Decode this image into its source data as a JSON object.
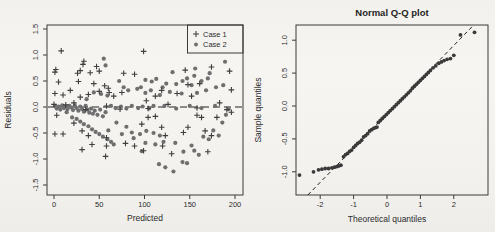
{
  "figure": {
    "background": "#f3f2ef",
    "ink": "#2b2b2b"
  },
  "chart_data": [
    {
      "type": "scatter",
      "title": "",
      "xlabel": "Predicted",
      "ylabel": "Residuals",
      "xlim": [
        0,
        200
      ],
      "ylim": [
        -1.5,
        1.5
      ],
      "xticks": [
        "0",
        "50",
        "100",
        "150",
        "200"
      ],
      "yticks": [
        "1.5",
        "1.0",
        "0.5",
        "0.0",
        "-0.5",
        "-1.0",
        "-1.5"
      ],
      "grid": false,
      "legend_position": "top-right",
      "zero_line": {
        "y": 0,
        "style": "dashed"
      },
      "series": [
        {
          "name": "Case 1",
          "marker": "plus",
          "color": "#3e3e3e",
          "points": [
            [
              8,
              1.08
            ],
            [
              99,
              1.07
            ],
            [
              1,
              0.67
            ],
            [
              2,
              0.72
            ],
            [
              5,
              0.48
            ],
            [
              26,
              0.65
            ],
            [
              27,
              0.49
            ],
            [
              29,
              0.7
            ],
            [
              32,
              0.82
            ],
            [
              33,
              0.88
            ],
            [
              40,
              0.66
            ],
            [
              44,
              0.45
            ],
            [
              47,
              0.78
            ],
            [
              50,
              0.69
            ],
            [
              56,
              0.41
            ],
            [
              60,
              0.36
            ],
            [
              61,
              0.28
            ],
            [
              77,
              0.65
            ],
            [
              89,
              0.63
            ],
            [
              145,
              0.71
            ],
            [
              174,
              0.77
            ],
            [
              148,
              0.43
            ],
            [
              161,
              0.45
            ],
            [
              194,
              0.69
            ],
            [
              196,
              0.33
            ],
            [
              1,
              0.26
            ],
            [
              10,
              0.23
            ],
            [
              18,
              0.32
            ],
            [
              29,
              0.19
            ],
            [
              38,
              0.24
            ],
            [
              50,
              0.3
            ],
            [
              66,
              0.21
            ],
            [
              75,
              0.28
            ],
            [
              112,
              0.21
            ],
            [
              119,
              0.32
            ],
            [
              136,
              0.26
            ],
            [
              152,
              0.21
            ],
            [
              0,
              0.05
            ],
            [
              13,
              0.04
            ],
            [
              22,
              0.08
            ],
            [
              35,
              -0.05
            ],
            [
              58,
              0.02
            ],
            [
              73,
              -0.04
            ],
            [
              102,
              0.12
            ],
            [
              104,
              -0.03
            ],
            [
              126,
              0.05
            ],
            [
              158,
              -0.02
            ],
            [
              183,
              0.08
            ],
            [
              191,
              -0.05
            ],
            [
              3,
              -0.16
            ],
            [
              1,
              -0.52
            ],
            [
              10,
              -0.52
            ],
            [
              22,
              -0.31
            ],
            [
              31,
              -0.46
            ],
            [
              38,
              -0.55
            ],
            [
              42,
              -0.72
            ],
            [
              31,
              -0.82
            ],
            [
              58,
              -0.59
            ],
            [
              58,
              -0.75
            ],
            [
              57,
              -0.95
            ],
            [
              79,
              -0.7
            ],
            [
              89,
              -0.75
            ],
            [
              97,
              -0.33
            ],
            [
              99,
              -0.84
            ],
            [
              104,
              -0.2
            ],
            [
              112,
              -0.18
            ],
            [
              119,
              -0.39
            ],
            [
              123,
              -0.55
            ],
            [
              120,
              -0.75
            ],
            [
              130,
              -0.9
            ],
            [
              143,
              -0.49
            ],
            [
              148,
              -0.39
            ],
            [
              158,
              -0.16
            ],
            [
              163,
              -0.2
            ],
            [
              167,
              -0.46
            ],
            [
              174,
              -0.55
            ],
            [
              180,
              -0.2
            ],
            [
              170,
              -0.86
            ],
            [
              196,
              -0.1
            ]
          ]
        },
        {
          "name": "Case 2",
          "marker": "circle",
          "color": "#6f6f6f",
          "points": [
            [
              1,
              0.02
            ],
            [
              3,
              -0.03
            ],
            [
              5,
              0.01
            ],
            [
              7,
              -0.05
            ],
            [
              9,
              0.03
            ],
            [
              11,
              -0.02
            ],
            [
              13,
              0.01
            ],
            [
              15,
              -0.04
            ],
            [
              17,
              0.02
            ],
            [
              19,
              -0.01
            ],
            [
              21,
              -0.06
            ],
            [
              23,
              0.03
            ],
            [
              25,
              -0.02
            ],
            [
              27,
              -0.07
            ],
            [
              29,
              0.01
            ],
            [
              31,
              -0.04
            ],
            [
              33,
              -0.09
            ],
            [
              35,
              0.02
            ],
            [
              37,
              -0.05
            ],
            [
              39,
              -0.11
            ],
            [
              41,
              -0.03
            ],
            [
              43,
              -0.13
            ],
            [
              45,
              -0.07
            ],
            [
              48,
              -0.15
            ],
            [
              51,
              -0.05
            ],
            [
              54,
              -0.18
            ],
            [
              57,
              -0.1
            ],
            [
              63,
              0.02
            ],
            [
              68,
              -0.02
            ],
            [
              74,
              0.01
            ],
            [
              80,
              -0.03
            ],
            [
              86,
              0.02
            ],
            [
              93,
              -0.02
            ],
            [
              98,
              0.01
            ],
            [
              105,
              -0.03
            ],
            [
              110,
              0.02
            ],
            [
              122,
              0.02
            ],
            [
              135,
              -0.03
            ],
            [
              150,
              0.02
            ],
            [
              163,
              -0.02
            ],
            [
              178,
              0.02
            ],
            [
              193,
              -0.04
            ],
            [
              14,
              -0.1
            ],
            [
              20,
              -0.2
            ],
            [
              25,
              -0.23
            ],
            [
              29,
              -0.28
            ],
            [
              33,
              -0.33
            ],
            [
              38,
              -0.37
            ],
            [
              42,
              -0.43
            ],
            [
              46,
              -0.48
            ],
            [
              50,
              -0.52
            ],
            [
              54,
              -0.57
            ],
            [
              59,
              -0.62
            ],
            [
              63,
              -0.67
            ],
            [
              66,
              -0.72
            ],
            [
              55,
              0.93
            ],
            [
              57,
              0.8
            ],
            [
              189,
              0.87
            ],
            [
              172,
              0.65
            ],
            [
              156,
              0.74
            ],
            [
              131,
              0.67
            ],
            [
              101,
              0.52
            ],
            [
              108,
              0.49
            ],
            [
              113,
              0.54
            ],
            [
              124,
              0.45
            ],
            [
              142,
              0.5
            ],
            [
              152,
              0.42
            ],
            [
              163,
              0.5
            ],
            [
              72,
              0.5
            ],
            [
              77,
              0.38
            ],
            [
              82,
              0.32
            ],
            [
              92,
              0.35
            ],
            [
              101,
              0.27
            ],
            [
              107,
              0.32
            ],
            [
              117,
              0.23
            ],
            [
              128,
              0.29
            ],
            [
              141,
              0.26
            ],
            [
              158,
              0.27
            ],
            [
              168,
              0.32
            ],
            [
              179,
              0.38
            ],
            [
              187,
              0.42
            ],
            [
              44,
              0.28
            ],
            [
              52,
              0.25
            ],
            [
              59,
              0.22
            ],
            [
              36,
              0.15
            ],
            [
              96,
              0.38
            ],
            [
              120,
              0.38
            ],
            [
              135,
              0.44
            ],
            [
              147,
              0.55
            ],
            [
              155,
              0.6
            ],
            [
              170,
              0.55
            ],
            [
              75,
              -0.52
            ],
            [
              86,
              -0.49
            ],
            [
              95,
              -0.52
            ],
            [
              102,
              -0.46
            ],
            [
              110,
              -0.5
            ],
            [
              117,
              -0.55
            ],
            [
              101,
              -0.69
            ],
            [
              112,
              -0.72
            ],
            [
              121,
              -0.67
            ],
            [
              134,
              -0.69
            ],
            [
              116,
              -1.1
            ],
            [
              123,
              -1.16
            ],
            [
              132,
              -1.24
            ],
            [
              142,
              -1.06
            ],
            [
              147,
              -1.08
            ],
            [
              155,
              -0.84
            ],
            [
              160,
              -0.92
            ],
            [
              143,
              -0.86
            ],
            [
              152,
              -0.74
            ],
            [
              165,
              -0.57
            ],
            [
              171,
              -0.62
            ],
            [
              176,
              -0.45
            ],
            [
              182,
              -0.55
            ],
            [
              186,
              -0.3
            ],
            [
              190,
              -0.15
            ],
            [
              97,
              -0.85
            ],
            [
              88,
              -0.6
            ],
            [
              80,
              -0.38
            ],
            [
              69,
              -0.3
            ],
            [
              60,
              -0.45
            ]
          ]
        }
      ]
    },
    {
      "type": "scatter",
      "title": "Normal Q-Q plot",
      "xlabel": "Theoretical quantiles",
      "ylabel": "Sample quantiles",
      "xlim": [
        -2.7,
        2.7
      ],
      "ylim": [
        -1.15,
        1.2
      ],
      "xticks": [
        "-2",
        "-1",
        "0",
        "1",
        "2"
      ],
      "yticks": [
        "1.0",
        "0.5",
        "0.0",
        "-0.5",
        "-1.0"
      ],
      "grid": false,
      "marker": "circle",
      "color": "#3a3a3a",
      "ref_line": {
        "slope": 0.52,
        "intercept": -0.12,
        "style": "dashed"
      },
      "points": [
        [
          -2.62,
          -1.05
        ],
        [
          -2.2,
          -1.0
        ],
        [
          -2.05,
          -0.97
        ],
        [
          -1.95,
          -0.96
        ],
        [
          -1.85,
          -0.95
        ],
        [
          -1.75,
          -0.95
        ],
        [
          -1.65,
          -0.94
        ],
        [
          -1.57,
          -0.93
        ],
        [
          -1.5,
          -0.92
        ],
        [
          -1.44,
          -0.91
        ],
        [
          -1.38,
          -0.9
        ],
        [
          -1.3,
          -0.77
        ],
        [
          -1.24,
          -0.74
        ],
        [
          -1.18,
          -0.72
        ],
        [
          -1.12,
          -0.69
        ],
        [
          -1.06,
          -0.67
        ],
        [
          -1.0,
          -0.63
        ],
        [
          -0.94,
          -0.6
        ],
        [
          -0.88,
          -0.57
        ],
        [
          -0.82,
          -0.55
        ],
        [
          -0.76,
          -0.52
        ],
        [
          -0.7,
          -0.47
        ],
        [
          -0.64,
          -0.45
        ],
        [
          -0.58,
          -0.42
        ],
        [
          -0.52,
          -0.38
        ],
        [
          -0.46,
          -0.36
        ],
        [
          -0.4,
          -0.34
        ],
        [
          -0.35,
          -0.33
        ],
        [
          -0.3,
          -0.32
        ],
        [
          -0.26,
          -0.25
        ],
        [
          -0.2,
          -0.22
        ],
        [
          -0.14,
          -0.19
        ],
        [
          -0.08,
          -0.16
        ],
        [
          -0.02,
          -0.13
        ],
        [
          0.04,
          -0.1
        ],
        [
          0.1,
          -0.07
        ],
        [
          0.16,
          -0.04
        ],
        [
          0.22,
          -0.01
        ],
        [
          0.28,
          0.02
        ],
        [
          0.34,
          0.05
        ],
        [
          0.4,
          0.08
        ],
        [
          0.46,
          0.11
        ],
        [
          0.52,
          0.14
        ],
        [
          0.58,
          0.17
        ],
        [
          0.64,
          0.2
        ],
        [
          0.7,
          0.23
        ],
        [
          0.76,
          0.27
        ],
        [
          0.82,
          0.3
        ],
        [
          0.88,
          0.33
        ],
        [
          0.94,
          0.36
        ],
        [
          1.0,
          0.39
        ],
        [
          1.06,
          0.42
        ],
        [
          1.12,
          0.45
        ],
        [
          1.18,
          0.48
        ],
        [
          1.24,
          0.51
        ],
        [
          1.3,
          0.54
        ],
        [
          1.38,
          0.58
        ],
        [
          1.46,
          0.61
        ],
        [
          1.55,
          0.65
        ],
        [
          1.63,
          0.67
        ],
        [
          1.71,
          0.69
        ],
        [
          1.8,
          0.71
        ],
        [
          1.9,
          0.72
        ],
        [
          2.0,
          0.77
        ],
        [
          2.2,
          1.08
        ],
        [
          2.62,
          1.12
        ]
      ]
    }
  ]
}
